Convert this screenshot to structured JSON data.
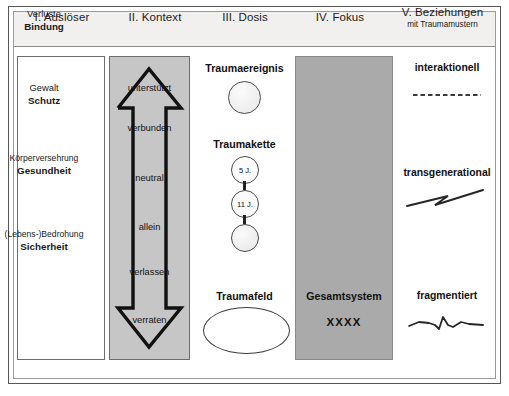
{
  "diagram": {
    "columns": [
      {
        "id": "ausloeser",
        "numeral": "I. Auslöser",
        "subtitle": ""
      },
      {
        "id": "kontext",
        "numeral": "II. Kontext",
        "subtitle": ""
      },
      {
        "id": "dosis",
        "numeral": "III. Dosis",
        "subtitle": ""
      },
      {
        "id": "fokus",
        "numeral": "IV. Fokus",
        "subtitle": ""
      },
      {
        "id": "beziehungen",
        "numeral": "V. Beziehungen",
        "subtitle": "mit Traumamustern"
      }
    ]
  },
  "ausloeser": {
    "items": [
      {
        "top": "Verluste",
        "bottom": "Bindung"
      },
      {
        "top": "Gewalt",
        "bottom": "Schutz"
      },
      {
        "top": "Körperversehrung",
        "bottom": "Gesundheit"
      },
      {
        "top": "(Lebens-)Bedrohung",
        "bottom": "Sicherheit"
      }
    ]
  },
  "kontext": {
    "arrow": "double-headed-vertical-arrow",
    "levels": [
      "unterstützt",
      "verbunden",
      "neutral",
      "allein",
      "verlassen",
      "verraten"
    ]
  },
  "dosis": {
    "traumaereignis": {
      "label": "Traumaereignis",
      "shape": "circle"
    },
    "traumakette": {
      "label": "Traumakette",
      "nodes": [
        {
          "age": "5 J."
        },
        {
          "age": "11 J."
        },
        {
          "age": ""
        }
      ]
    },
    "traumafeld": {
      "label": "Traumafeld",
      "shape": "ellipse"
    }
  },
  "fokus": {
    "label": "Gesamtsystem",
    "marks": "XXXX"
  },
  "beziehungen": {
    "patterns": [
      {
        "label": "interaktionell",
        "glyph": "dashed-line-icon"
      },
      {
        "label": "transgenerational",
        "glyph": "lightning-zigzag-icon"
      },
      {
        "label": "fragmentiert",
        "glyph": "jagged-wave-icon"
      }
    ]
  },
  "colors": {
    "kontext_fill": "#c6c6c6",
    "fokus_fill": "#aaaaaa",
    "header_fill": "#f1f0ee",
    "stroke": "#6d6d6d",
    "text": "#1a1a1a"
  }
}
